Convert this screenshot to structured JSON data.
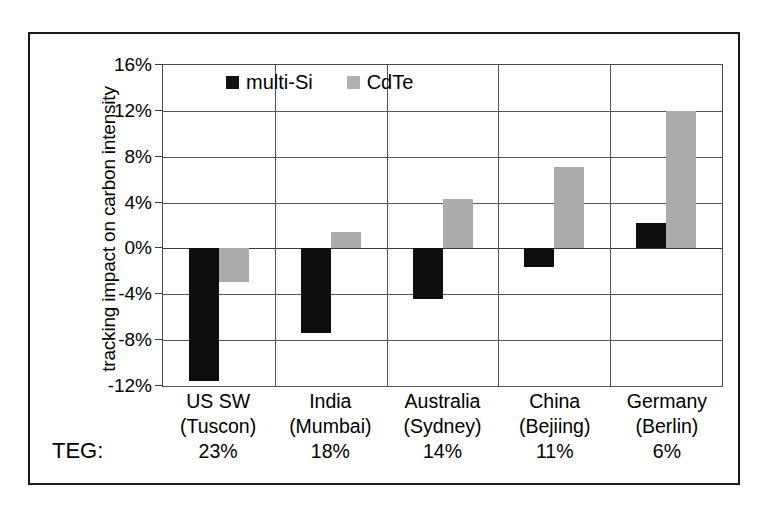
{
  "chart_data": {
    "type": "bar",
    "title": "",
    "xlabel": "",
    "ylabel": "tracking impact on carbon intensity",
    "ylim": [
      -12,
      16
    ],
    "ytick_labels": [
      "16%",
      "12%",
      "8%",
      "4%",
      "0%",
      "-4%",
      "-8%",
      "-12%"
    ],
    "ytick_values": [
      16,
      12,
      8,
      4,
      0,
      -4,
      -8,
      -12
    ],
    "grid": true,
    "legend_position": "top-center",
    "categories": [
      "US SW\n(Tuscon)",
      "India\n(Mumbai)",
      "Australia\n(Sydney)",
      "China\n(Bejiing)",
      "Germany\n(Berlin)"
    ],
    "series": [
      {
        "name": "multi-Si",
        "color": "#0d0d0d",
        "values": [
          -11.6,
          -7.4,
          -4.4,
          -1.6,
          2.2
        ]
      },
      {
        "name": "CdTe",
        "color": "#ababab",
        "values": [
          -2.9,
          1.4,
          4.3,
          7.1,
          12.0
        ]
      }
    ],
    "annotations": {
      "teg_label": "TEG:",
      "teg_values": [
        "23%",
        "18%",
        "14%",
        "11%",
        "6%"
      ]
    }
  },
  "axis": {
    "y_title": "tracking impact on carbon intensity",
    "ticks": [
      {
        "label": "16%",
        "value": 16
      },
      {
        "label": "12%",
        "value": 12
      },
      {
        "label": "8%",
        "value": 8
      },
      {
        "label": "4%",
        "value": 4
      },
      {
        "label": "0%",
        "value": 0
      },
      {
        "label": "-4%",
        "value": -4
      },
      {
        "label": "-8%",
        "value": -8
      },
      {
        "label": "-12%",
        "value": -12
      }
    ]
  },
  "legend": {
    "entries": [
      {
        "label": "multi-Si",
        "color": "#0d0d0d"
      },
      {
        "label": "CdTe",
        "color": "#ababab"
      }
    ]
  },
  "categories": [
    {
      "name": "US SW",
      "city": "(Tuscon)",
      "teg": "23%"
    },
    {
      "name": "India",
      "city": "(Mumbai)",
      "teg": "18%"
    },
    {
      "name": "Australia",
      "city": "(Sydney)",
      "teg": "14%"
    },
    {
      "name": "China",
      "city": "(Bejiing)",
      "teg": "11%"
    },
    {
      "name": "Germany",
      "city": "(Berlin)",
      "teg": "6%"
    }
  ],
  "teg": {
    "label": "TEG:"
  }
}
